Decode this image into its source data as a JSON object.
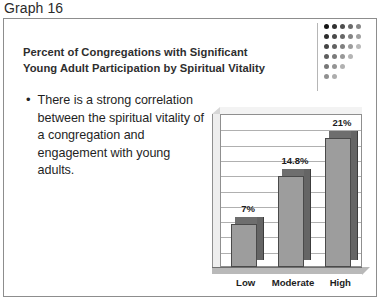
{
  "caption": "Graph 16",
  "slide": {
    "heading_line1": "Percent of Congregations with Significant",
    "heading_line2": "Young Adult Participation by Spiritual Vitality",
    "bullet_marker": "•",
    "bullet_text": "There is a strong correlation between the spiritual vitality of a congregation and engagement with young adults."
  },
  "logo": {
    "name": "dot-matrix-logo",
    "rows": 6,
    "columns": 5,
    "color_dark": "#1a1a1a",
    "color_light": "#e9e9e9"
  },
  "colors": {
    "bar_front": "#9d9d9d",
    "bar_side": "#656565",
    "bar_top": "#6e6e6e",
    "gridline": "#b0b0b0",
    "border": "#8d8d8d",
    "text": "#1f1f1f"
  },
  "chart_data": {
    "type": "bar",
    "title": "Percent of Congregations with Significant Young Adult Participation by Spiritual Vitality",
    "categories": [
      "Low",
      "Moderate",
      "High"
    ],
    "values": [
      7,
      14.8,
      21
    ],
    "data_labels": [
      "7%",
      "14.8%",
      "21%"
    ],
    "xlabel": "",
    "ylabel": "",
    "ylim": [
      0,
      25
    ],
    "grid": true,
    "gridlines": 9,
    "tick_labels": [],
    "legend": false,
    "three_d": true
  }
}
